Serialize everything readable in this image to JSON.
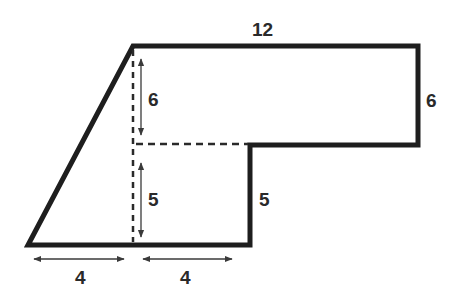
{
  "diagram": {
    "shape": "composite-polygon",
    "colors": {
      "outline": "#1e1e1e",
      "dashed": "#2a2a2a",
      "arrow": "#3a3a3a",
      "label": "#2a2a2a",
      "background": "#ffffff"
    },
    "labels": {
      "top": "12",
      "right_upper": "6",
      "inner_upper": "6",
      "inner_lower": "5",
      "right_lower": "5",
      "bottom_left": "4",
      "bottom_right": "4"
    }
  }
}
